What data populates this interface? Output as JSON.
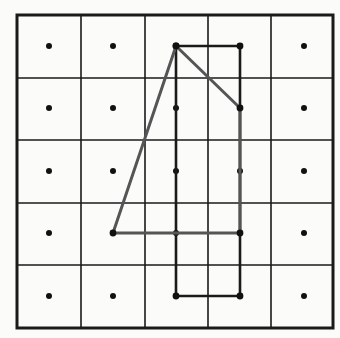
{
  "diagram": {
    "type": "dot-grid-geometry",
    "grid": {
      "rows": 5,
      "cols": 5,
      "x_lines": [
        17,
        81,
        145,
        208,
        271,
        333
      ],
      "y_lines": [
        15,
        78,
        140,
        203,
        265,
        328
      ],
      "line_color": "#1a1a1a",
      "border_width": 3,
      "line_width": 1.6
    },
    "dots": {
      "x": [
        49,
        113,
        176,
        240,
        304
      ],
      "y": [
        46,
        108,
        171,
        233,
        296
      ],
      "radius": 3,
      "color": "#111111"
    },
    "shapes": [
      {
        "name": "rectangle",
        "stroke": "#1a1a1a",
        "stroke_width": 2.6,
        "points": [
          [
            176,
            46
          ],
          [
            240,
            46
          ],
          [
            240,
            296
          ],
          [
            176,
            296
          ]
        ]
      },
      {
        "name": "quadrilateral",
        "stroke": "#555555",
        "stroke_width": 3,
        "points": [
          [
            176,
            46
          ],
          [
            240,
            108
          ],
          [
            240,
            233
          ],
          [
            113,
            233
          ]
        ]
      }
    ]
  }
}
